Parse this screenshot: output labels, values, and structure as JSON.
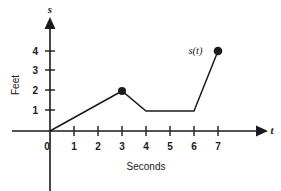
{
  "chart_data": {
    "type": "line",
    "title": "",
    "subtitle": "",
    "xlabel": "Seconds",
    "ylabel": "Feet",
    "x_axis_variable": "t",
    "y_axis_variable": "s",
    "xlim": [
      0,
      7.6
    ],
    "ylim": [
      0,
      4.6
    ],
    "grid": false,
    "legend": "none",
    "xticks": [
      "0",
      "1",
      "2",
      "3",
      "4",
      "5",
      "6",
      "7"
    ],
    "xtick_values": [
      0,
      1,
      2,
      3,
      4,
      5,
      6,
      7
    ],
    "yticks": [
      "1",
      "2",
      "3",
      "4"
    ],
    "ytick_values": [
      1,
      2,
      3,
      4
    ],
    "series": [
      {
        "name": "s(t)",
        "x": [
          0,
          3,
          4,
          6,
          7
        ],
        "values": [
          0,
          2,
          1,
          1,
          4
        ]
      }
    ],
    "markers": [
      {
        "x": 3,
        "y": 2,
        "style": "filled-circle"
      },
      {
        "x": 7,
        "y": 4,
        "style": "filled-circle"
      }
    ],
    "annotations": [
      {
        "text": "s(t)",
        "x": 6.35,
        "y": 4.05
      }
    ],
    "colors": {
      "line": "#1a1a1a",
      "axis": "#1a1a1a",
      "text": "#1a1a1a",
      "background": "#ffffff"
    }
  }
}
